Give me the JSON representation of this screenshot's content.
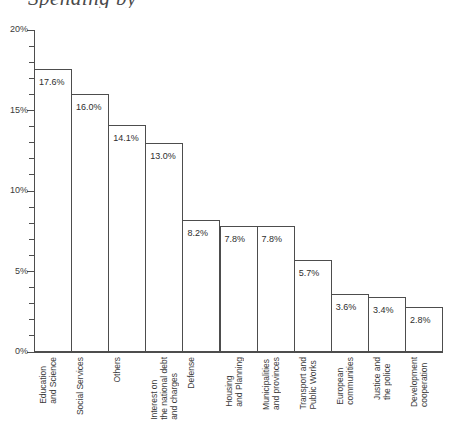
{
  "title": {
    "cropped_text": "Spending by"
  },
  "chart_data": {
    "type": "bar",
    "title": "Spending by",
    "xlabel": "",
    "ylabel": "",
    "ylim": [
      0,
      20
    ],
    "ytick_labels": [
      "0%",
      "5%",
      "10%",
      "15%",
      "20%"
    ],
    "ytick_values": [
      0,
      5,
      10,
      15,
      20
    ],
    "minor_tick_interval": 1,
    "grid": false,
    "legend": "none",
    "value_label_suffix": "%",
    "categories": [
      "Education\nand Science",
      "Social Services",
      "Others",
      "Interest on\nthe national debt\nand charges",
      "Defense",
      "Housing\nand Planning",
      "Municipalities\nand provinces",
      "Transport and\nPublic Works",
      "European\ncommunities",
      "Justice and\nthe police",
      "Development\ncooperation"
    ],
    "values": [
      17.6,
      16.0,
      14.1,
      13.0,
      8.2,
      7.8,
      7.8,
      5.7,
      3.6,
      3.4,
      2.8
    ],
    "value_labels": [
      "17.6%",
      "16.0%",
      "14.1%",
      "13.0%",
      "8.2%",
      "7.8%",
      "7.8%",
      "5.7%",
      "3.6%",
      "3.4%",
      "2.8%"
    ]
  },
  "colors": {
    "bar_fill": "#ffffff",
    "bar_outline": "#4d4d4d",
    "axis": "#4d4d4d",
    "text": "#3b3b3b",
    "background": "#ffffff"
  }
}
